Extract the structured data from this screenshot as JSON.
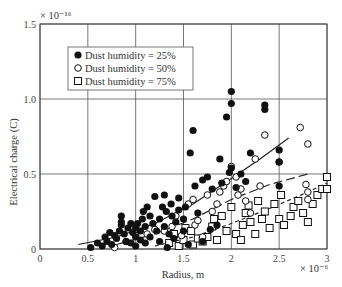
{
  "chart_data": {
    "type": "scatter",
    "title": "",
    "xlabel": "Radius, m",
    "ylabel": "Electrical charge (C)",
    "x_multiplier": "× 10⁻⁶",
    "y_multiplier": "× 10⁻¹⁶",
    "xlim": [
      0,
      3
    ],
    "ylim": [
      0,
      1.5
    ],
    "xticks": [
      "0",
      "0.5",
      "1",
      "1.5",
      "2",
      "2.5",
      "3"
    ],
    "yticks": [
      "0",
      "0.5",
      "1.0",
      "1.5"
    ],
    "grid": true,
    "legend_position": "upper-left",
    "series": [
      {
        "name": "Dust humidity = 25%",
        "marker": "filled-circle",
        "color": "#111111",
        "points": [
          [
            0.53,
            0.01
          ],
          [
            0.6,
            0.04
          ],
          [
            0.65,
            0.02
          ],
          [
            0.68,
            0.08
          ],
          [
            0.7,
            0.05
          ],
          [
            0.73,
            0.11
          ],
          [
            0.75,
            0.03
          ],
          [
            0.78,
            0.09
          ],
          [
            0.8,
            0.07
          ],
          [
            0.83,
            0.12
          ],
          [
            0.85,
            0.16
          ],
          [
            0.85,
            0.22
          ],
          [
            0.85,
            0.18
          ],
          [
            0.88,
            0.1
          ],
          [
            0.9,
            0.05
          ],
          [
            0.92,
            0.14
          ],
          [
            0.95,
            0.04
          ],
          [
            0.95,
            0.17
          ],
          [
            0.97,
            0.11
          ],
          [
            1.0,
            0.02
          ],
          [
            1.0,
            0.14
          ],
          [
            1.0,
            0.08
          ],
          [
            1.02,
            0.17
          ],
          [
            1.05,
            0.06
          ],
          [
            1.05,
            0.12
          ],
          [
            1.07,
            0.2
          ],
          [
            1.08,
            0.25
          ],
          [
            1.1,
            0.04
          ],
          [
            1.1,
            0.15
          ],
          [
            1.12,
            0.28
          ],
          [
            1.15,
            0.22
          ],
          [
            1.15,
            0.08
          ],
          [
            1.18,
            0.17
          ],
          [
            1.2,
            0.35
          ],
          [
            1.22,
            0.12
          ],
          [
            1.25,
            0.05
          ],
          [
            1.25,
            0.2
          ],
          [
            1.28,
            0.28
          ],
          [
            1.3,
            0.36
          ],
          [
            1.3,
            0.15
          ],
          [
            1.32,
            0.25
          ],
          [
            1.33,
            0.01
          ],
          [
            1.35,
            0.1
          ],
          [
            1.37,
            0.3
          ],
          [
            1.38,
            0.22
          ],
          [
            1.4,
            0.07
          ],
          [
            1.42,
            0.18
          ],
          [
            1.45,
            0.26
          ],
          [
            1.45,
            0.34
          ],
          [
            1.5,
            0.12
          ],
          [
            1.5,
            0.2
          ],
          [
            1.52,
            0.28
          ],
          [
            1.55,
            0.03
          ],
          [
            1.57,
            0.64
          ],
          [
            1.6,
            0.79
          ],
          [
            1.62,
            0.42
          ],
          [
            1.65,
            0.24
          ],
          [
            1.7,
            0.46
          ],
          [
            1.7,
            0.05
          ],
          [
            1.75,
            0.48
          ],
          [
            1.78,
            0.13
          ],
          [
            1.8,
            0.4
          ],
          [
            1.85,
            0.16
          ],
          [
            1.88,
            0.6
          ],
          [
            1.9,
            0.44
          ],
          [
            1.95,
            0.88
          ],
          [
            1.98,
            0.51
          ],
          [
            2.0,
            0.54
          ],
          [
            2.0,
            0.97
          ],
          [
            2.0,
            1.05
          ],
          [
            2.05,
            0.41
          ],
          [
            2.1,
            0.5
          ],
          [
            2.15,
            0.45
          ],
          [
            2.2,
            0.64
          ],
          [
            2.35,
            0.93
          ],
          [
            2.35,
            0.96
          ],
          [
            2.5,
            0.58
          ],
          [
            2.5,
            0.66
          ],
          [
            2.5,
            0.42
          ]
        ]
      },
      {
        "name": "Dust humidity = 50%",
        "marker": "open-circle",
        "color": "#111111",
        "points": [
          [
            0.78,
            0.01
          ],
          [
            0.9,
            0.05
          ],
          [
            1.0,
            0.09
          ],
          [
            1.12,
            0.1
          ],
          [
            1.2,
            0.13
          ],
          [
            1.3,
            0.12
          ],
          [
            1.38,
            0.15
          ],
          [
            1.42,
            0.22
          ],
          [
            1.48,
            0.09
          ],
          [
            1.55,
            0.3
          ],
          [
            1.6,
            0.33
          ],
          [
            1.62,
            0.16
          ],
          [
            1.65,
            0.19
          ],
          [
            1.7,
            0.08
          ],
          [
            1.75,
            0.36
          ],
          [
            1.8,
            0.25
          ],
          [
            1.85,
            0.3
          ],
          [
            1.88,
            0.38
          ],
          [
            1.92,
            0.42
          ],
          [
            1.95,
            0.45
          ],
          [
            2.0,
            0.55
          ],
          [
            2.05,
            0.48
          ],
          [
            2.07,
            0.36
          ],
          [
            2.1,
            0.4
          ],
          [
            2.15,
            0.32
          ],
          [
            2.2,
            0.24
          ],
          [
            2.25,
            0.6
          ],
          [
            2.3,
            0.42
          ],
          [
            2.35,
            0.76
          ],
          [
            2.5,
            0.58
          ],
          [
            2.72,
            0.81
          ],
          [
            2.78,
            0.43
          ],
          [
            2.8,
            0.38
          ],
          [
            2.8,
            0.7
          ],
          [
            2.8,
            0.33
          ]
        ]
      },
      {
        "name": "Dust humidity = 75%",
        "marker": "open-square",
        "color": "#111111",
        "points": [
          [
            1.35,
            0.04
          ],
          [
            1.4,
            0.1
          ],
          [
            1.45,
            0.02
          ],
          [
            1.5,
            0.06
          ],
          [
            1.52,
            0.14
          ],
          [
            1.58,
            0.12
          ],
          [
            1.6,
            0.03
          ],
          [
            1.65,
            0.07
          ],
          [
            1.7,
            0.05
          ],
          [
            1.75,
            0.08
          ],
          [
            1.8,
            0.15
          ],
          [
            1.82,
            0.2
          ],
          [
            1.85,
            0.06
          ],
          [
            1.9,
            0.22
          ],
          [
            1.95,
            0.12
          ],
          [
            2.0,
            0.28
          ],
          [
            2.05,
            0.1
          ],
          [
            2.1,
            0.06
          ],
          [
            2.12,
            0.16
          ],
          [
            2.15,
            0.24
          ],
          [
            2.18,
            0.29
          ],
          [
            2.2,
            0.18
          ],
          [
            2.25,
            0.1
          ],
          [
            2.28,
            0.32
          ],
          [
            2.32,
            0.2
          ],
          [
            2.35,
            0.25
          ],
          [
            2.4,
            0.14
          ],
          [
            2.45,
            0.3
          ],
          [
            2.5,
            0.2
          ],
          [
            2.52,
            0.36
          ],
          [
            2.55,
            0.16
          ],
          [
            2.62,
            0.22
          ],
          [
            2.65,
            0.28
          ],
          [
            2.7,
            0.32
          ],
          [
            2.75,
            0.24
          ],
          [
            2.8,
            0.18
          ],
          [
            2.85,
            0.3
          ],
          [
            2.9,
            0.36
          ],
          [
            2.95,
            0.4
          ],
          [
            3.0,
            0.48
          ],
          [
            3.0,
            0.4
          ]
        ]
      }
    ],
    "fit_curves": [
      {
        "series": "Dust humidity = 25%",
        "style": "solid",
        "x": [
          0.4,
          0.8,
          1.2,
          1.6,
          2.0,
          2.3,
          2.6
        ],
        "y": [
          0.03,
          0.08,
          0.17,
          0.3,
          0.47,
          0.6,
          0.74
        ]
      },
      {
        "series": "Dust humidity = 50%",
        "style": "dashed",
        "x": [
          0.8,
          1.2,
          1.6,
          2.0,
          2.4,
          2.8
        ],
        "y": [
          0.03,
          0.1,
          0.2,
          0.33,
          0.43,
          0.5
        ]
      },
      {
        "series": "Dust humidity = 75%",
        "style": "dotted-dash",
        "x": [
          1.2,
          1.6,
          2.0,
          2.4,
          2.8,
          3.0
        ],
        "y": [
          0.02,
          0.08,
          0.17,
          0.27,
          0.38,
          0.44
        ]
      }
    ]
  },
  "legend": {
    "items": [
      {
        "label": "Dust humidity = 25%"
      },
      {
        "label": "Dust humidity = 50%"
      },
      {
        "label": "Dust humidity = 75%"
      }
    ]
  },
  "axes": {
    "xlabel": "Radius, m",
    "ylabel": "Electrical charge (C)",
    "x_multiplier": "× 10⁻⁶",
    "y_multiplier": "× 10⁻¹⁶",
    "xticks": [
      "0",
      "0.5",
      "1",
      "1.5",
      "2",
      "2.5",
      "3"
    ],
    "yticks": [
      "0",
      "0.5",
      "1.0",
      "1.5"
    ]
  }
}
